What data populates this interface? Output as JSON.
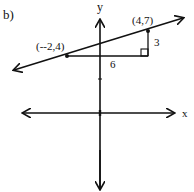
{
  "problem_label": "b)",
  "axes": {
    "x_label": "x",
    "y_label": "y"
  },
  "points": [
    {
      "label": "(--2,4)",
      "x": -2,
      "y": 4
    },
    {
      "label": "(4,7)",
      "x": 4,
      "y": 7
    }
  ],
  "triangle": {
    "run_label": "6",
    "rise_label": "3"
  },
  "colors": {
    "ink": "#111111",
    "background": "#ffffff"
  }
}
